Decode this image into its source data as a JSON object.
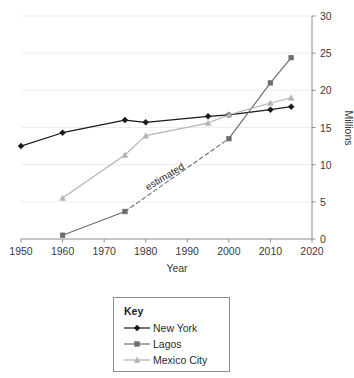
{
  "chart_data": {
    "type": "line",
    "title": "",
    "xlabel": "Year",
    "ylabel": "Millions",
    "xlim": [
      1950,
      2020
    ],
    "ylim": [
      0,
      30
    ],
    "xticks": [
      1950,
      1960,
      1970,
      1980,
      1990,
      2000,
      2010,
      2020
    ],
    "yticks": [
      0,
      5,
      10,
      15,
      20,
      25,
      30
    ],
    "grid": "horizontal",
    "y_axis_position": "right",
    "legend_position": "below-plot",
    "legend_title": "Key",
    "annotations": [
      {
        "text": "estimated",
        "x": 1985,
        "y": 8.0,
        "rotation": -31
      }
    ],
    "series": [
      {
        "name": "New York",
        "color": "#1a1a1a",
        "marker": "diamond",
        "x": [
          1950,
          1960,
          1975,
          1980,
          1995,
          2000,
          2010,
          2015
        ],
        "values": [
          12.5,
          14.3,
          16.0,
          15.7,
          16.5,
          16.7,
          17.4,
          17.8
        ]
      },
      {
        "name": "Lagos",
        "color": "#6e6e6e",
        "marker": "square",
        "x": [
          1960,
          1975,
          2000,
          2010,
          2015
        ],
        "values": [
          0.5,
          3.7,
          13.5,
          21.0,
          24.4
        ],
        "dashed_segment": {
          "from_index": 1,
          "to_index": 2,
          "label": "estimated"
        }
      },
      {
        "name": "Mexico City",
        "color": "#b3b3b3",
        "marker": "triangle",
        "x": [
          1960,
          1975,
          1980,
          1995,
          2000,
          2010,
          2015
        ],
        "values": [
          5.5,
          11.3,
          13.9,
          15.6,
          16.7,
          18.3,
          19.0
        ]
      }
    ]
  },
  "axes": {
    "x_title": "Year",
    "y_title": "Millions",
    "x_tick_labels": [
      "1950",
      "1960",
      "1970",
      "1980",
      "1990",
      "2000",
      "2010",
      "2020"
    ],
    "y_tick_labels": [
      "0",
      "5",
      "10",
      "15",
      "20",
      "25",
      "30"
    ]
  },
  "annotation": {
    "estimated": "estimated"
  },
  "legend": {
    "title": "Key",
    "items": [
      {
        "label": "New York",
        "color": "#1a1a1a",
        "marker": "diamond"
      },
      {
        "label": "Lagos",
        "color": "#6e6e6e",
        "marker": "square"
      },
      {
        "label": "Mexico City",
        "color": "#b3b3b3",
        "marker": "triangle"
      }
    ]
  },
  "colors": {
    "new_york": "#1a1a1a",
    "lagos": "#6e6e6e",
    "mexico_city": "#b3b3b3",
    "axis": "#8c8c8c",
    "grid": "#eceded",
    "text": "#3a3a3a"
  }
}
